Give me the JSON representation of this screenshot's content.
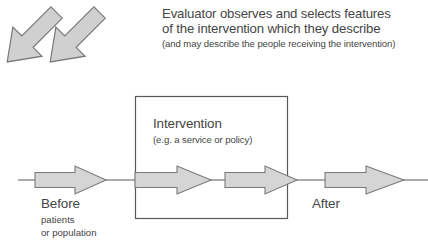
{
  "diagram": {
    "title": "Evaluator observes and selects features of the intervention which they describe",
    "caption": {
      "line1": "Evaluator observes and selects features",
      "line2": "of the intervention which they describe",
      "line3": "(and may describe the people receiving the intervention)"
    },
    "intervention_box": {
      "label": "Intervention",
      "sublabel": "(e.g. a service or policy)"
    },
    "before": {
      "label": "Before",
      "sub1": "patients",
      "sub2": "or population"
    },
    "after": {
      "label": "After"
    },
    "icons": {
      "flow_arrow": "right-arrow-icon",
      "observation_arrow": "down-left-diagonal-arrow-icon"
    },
    "colors": {
      "arrow_fill": "#d5d5d5",
      "arrow_stroke": "#737373",
      "box_stroke": "#595959",
      "line_stroke": "#5a5a5a",
      "text": "#454545",
      "background": "#ffffff"
    },
    "flow_arrows": [
      {
        "name": "flow-arrow-before",
        "shaft_x": 35,
        "tip_x": 106
      },
      {
        "name": "flow-arrow-intervention-1",
        "shaft_x": 135,
        "tip_x": 211
      },
      {
        "name": "flow-arrow-intervention-2",
        "shaft_x": 225,
        "tip_x": 297
      },
      {
        "name": "flow-arrow-after",
        "shaft_x": 325,
        "tip_x": 404
      }
    ],
    "observation_arrows": [
      {
        "name": "observation-arrow-left",
        "from_x": 230,
        "from_y": 52,
        "to_x": 185,
        "to_y": 104
      },
      {
        "name": "observation-arrow-right",
        "from_x": 272,
        "from_y": 52,
        "to_x": 228,
        "to_y": 104
      }
    ],
    "baseline_y": 180,
    "box": {
      "x": 135,
      "y": 96,
      "width": 152,
      "height": 122
    }
  }
}
